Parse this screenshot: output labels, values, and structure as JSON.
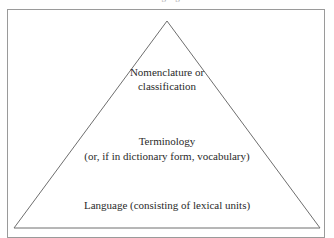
{
  "figure": {
    "type": "pyramid-diagram",
    "top_caption_sliver": "language",
    "frame_color": "#9a9a9a",
    "triangle_stroke_color": "#6e6e6e",
    "text_color": "#2a2a2a",
    "background_color": "#ffffff",
    "tiers": [
      {
        "id": "apex",
        "level": 1,
        "lines": [
          "Nomenclature or",
          "classification"
        ]
      },
      {
        "id": "middle",
        "level": 2,
        "lines": [
          "Terminology",
          "(or, if in dictionary form, vocabulary)"
        ]
      },
      {
        "id": "base",
        "level": 3,
        "lines": [
          "Language (consisting of lexical units)"
        ]
      }
    ]
  }
}
